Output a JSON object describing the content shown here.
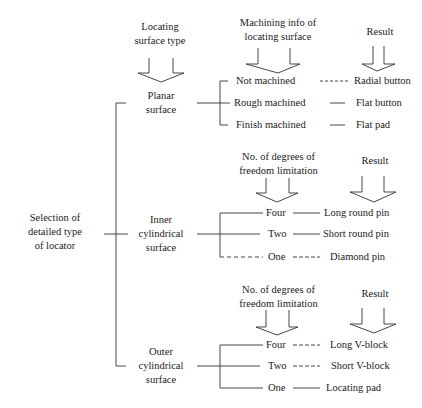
{
  "root": {
    "lines": [
      "Selection of",
      "detailed type",
      "of locator"
    ]
  },
  "headers": {
    "surface_type": [
      "Locating",
      "surface type"
    ],
    "machining_info": [
      "Machining info of",
      "locating surface"
    ],
    "dof1": [
      "No. of degrees of",
      "freedom limitation"
    ],
    "dof2": [
      "No. of degrees of",
      "freedom limitation"
    ],
    "result1": "Result",
    "result2": "Result",
    "result3": "Result"
  },
  "branches": [
    {
      "surface": [
        "Planar",
        "surface"
      ],
      "options": [
        {
          "condition": "Not machined",
          "result": "Radial button"
        },
        {
          "condition": "Rough machined",
          "result": "Flat button"
        },
        {
          "condition": "Finish machined",
          "result": "Flat pad"
        }
      ]
    },
    {
      "surface": [
        "Inner",
        "cylindrical",
        "surface"
      ],
      "options": [
        {
          "condition": "Four",
          "result": "Long round pin"
        },
        {
          "condition": "Two",
          "result": "Short round pin"
        },
        {
          "condition": "One",
          "result": "Diamond pin"
        }
      ]
    },
    {
      "surface": [
        "Outer",
        "cylindrical",
        "surface"
      ],
      "options": [
        {
          "condition": "Four",
          "result": "Long V-block"
        },
        {
          "condition": "Two",
          "result": "Short V-block"
        },
        {
          "condition": "One",
          "result": "Locating pad"
        }
      ]
    }
  ],
  "colors": {
    "line": "#333333",
    "text": "#1a1a1a",
    "background": "#ffffff"
  }
}
